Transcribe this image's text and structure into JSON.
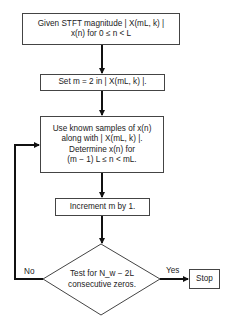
{
  "flowchart": {
    "nodes": [
      {
        "id": "start",
        "type": "process",
        "lines": [
          "Given STFT magnitude | X(mL, k) |",
          "x(n) for 0 ≤ n < L"
        ]
      },
      {
        "id": "init",
        "type": "process",
        "lines": [
          "Set m = 2 in | X(mL, k) |."
        ]
      },
      {
        "id": "estimate",
        "type": "process",
        "lines": [
          "Use known samples of x(n)",
          "along with | X(mL, k) |.",
          "Determine x(n) for",
          "(m − 1) L ≤ n < mL."
        ]
      },
      {
        "id": "increment",
        "type": "process",
        "lines": [
          "Increment m by 1."
        ]
      },
      {
        "id": "test",
        "type": "decision",
        "lines": [
          "Test for N_w − 2L",
          "consecutive zeros."
        ]
      },
      {
        "id": "stop",
        "type": "terminal",
        "lines": [
          "Stop"
        ]
      }
    ],
    "edges": [
      {
        "from": "start",
        "to": "init",
        "label": ""
      },
      {
        "from": "init",
        "to": "estimate",
        "label": ""
      },
      {
        "from": "estimate",
        "to": "increment",
        "label": ""
      },
      {
        "from": "increment",
        "to": "test",
        "label": ""
      },
      {
        "from": "test",
        "to": "stop",
        "label": "Yes"
      },
      {
        "from": "test",
        "to": "estimate",
        "label": "No"
      }
    ]
  },
  "labels": {
    "yes": "Yes",
    "no": "No",
    "stop": "Stop"
  }
}
